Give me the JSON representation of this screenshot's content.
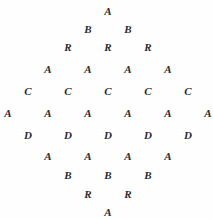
{
  "diagram": {
    "width": 213,
    "height": 219,
    "background_color": "#fefefe",
    "glyph_color": "#2b2b2b",
    "column_spacing": 40,
    "rows": [
      {
        "index": 1,
        "y": 6,
        "start_x": 102,
        "letters": [
          "A"
        ]
      },
      {
        "index": 2,
        "y": 24,
        "start_x": 82,
        "letters": [
          "B",
          "B"
        ]
      },
      {
        "index": 3,
        "y": 42,
        "start_x": 62,
        "letters": [
          "R",
          "R",
          "R"
        ]
      },
      {
        "index": 4,
        "y": 64,
        "start_x": 42,
        "letters": [
          "A",
          "A",
          "A",
          "A"
        ]
      },
      {
        "index": 5,
        "y": 86,
        "start_x": 22,
        "letters": [
          "C",
          "C",
          "C",
          "C",
          "C"
        ]
      },
      {
        "index": 6,
        "y": 108,
        "start_x": 2,
        "letters": [
          "A",
          "A",
          "A",
          "A",
          "A",
          "A"
        ]
      },
      {
        "index": 7,
        "y": 130,
        "start_x": 22,
        "letters": [
          "D",
          "D",
          "D",
          "D",
          "D"
        ]
      },
      {
        "index": 8,
        "y": 151,
        "start_x": 42,
        "letters": [
          "A",
          "A",
          "A",
          "A"
        ]
      },
      {
        "index": 9,
        "y": 170,
        "start_x": 62,
        "letters": [
          "B",
          "B",
          "B"
        ]
      },
      {
        "index": 10,
        "y": 189,
        "start_x": 82,
        "letters": [
          "R",
          "R"
        ]
      },
      {
        "index": 11,
        "y": 207,
        "start_x": 102,
        "letters": [
          "A"
        ]
      }
    ]
  }
}
